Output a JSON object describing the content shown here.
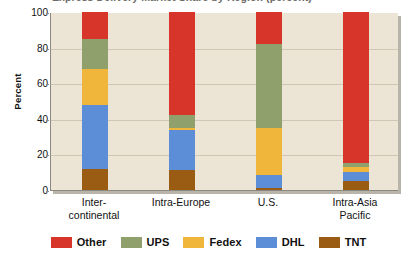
{
  "chart_data": {
    "type": "bar",
    "subtype": "stacked-bar-100",
    "title": "Express Delivery Market Share by Region (percent)",
    "xlabel": "",
    "ylabel": "Percent",
    "ylim": [
      0,
      100
    ],
    "yticks": [
      0,
      20,
      40,
      60,
      80,
      100
    ],
    "grid": true,
    "legend_position": "bottom",
    "categories": [
      "Inter-\ncontinental",
      "Intra-Europe",
      "U.S.",
      "Intra-Asia\nPacific"
    ],
    "category_labels": [
      {
        "line1": "Inter-",
        "line2": "continental"
      },
      {
        "line1": "Intra-Europe",
        "line2": ""
      },
      {
        "line1": "U.S.",
        "line2": ""
      },
      {
        "line1": "Intra-Asia",
        "line2": "Pacific"
      }
    ],
    "series": [
      {
        "name": "TNT",
        "color": "#9a5c12",
        "values": [
          12.0,
          11.5,
          1.0,
          5.0
        ]
      },
      {
        "name": "DHL",
        "color": "#5b8ed6",
        "values": [
          36.0,
          22.0,
          7.5,
          5.0
        ]
      },
      {
        "name": "Fedex",
        "color": "#f0b63c",
        "values": [
          20.0,
          1.5,
          26.5,
          3.0
        ]
      },
      {
        "name": "UPS",
        "color": "#8fa06c",
        "values": [
          17.0,
          7.0,
          47.0,
          2.0
        ]
      },
      {
        "name": "Other",
        "color": "#d8352a",
        "values": [
          15.0,
          58.0,
          18.0,
          85.0
        ]
      }
    ],
    "stack_order_bottom_to_top": [
      "TNT",
      "DHL",
      "Fedex",
      "UPS",
      "Other"
    ],
    "legend": [
      {
        "label": "Other",
        "color": "#d8352a"
      },
      {
        "label": "UPS",
        "color": "#8fa06c"
      },
      {
        "label": "Fedex",
        "color": "#f0b63c"
      },
      {
        "label": "DHL",
        "color": "#5b8ed6"
      },
      {
        "label": "TNT",
        "color": "#9a5c12"
      }
    ],
    "plot_background": "#ece4d4"
  }
}
